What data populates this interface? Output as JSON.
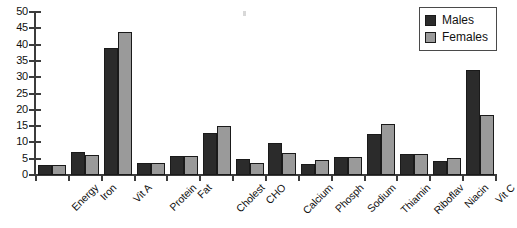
{
  "chart_data": {
    "type": "bar",
    "title": "",
    "xlabel": "",
    "ylabel": "",
    "ylim": [
      0,
      50
    ],
    "yticks": [
      0,
      5,
      10,
      15,
      20,
      25,
      30,
      35,
      40,
      45,
      50
    ],
    "grid": false,
    "legend_position": "top-right",
    "categories": [
      "Energy",
      "Iron",
      "Vit A",
      "Protein",
      "Fat",
      "Cholest",
      "CHO",
      "Calcium",
      "Phosph",
      "Sodium",
      "Thiamin",
      "Riboflav",
      "Niacin",
      "Vit C"
    ],
    "series": [
      {
        "name": "Males",
        "color": "#2b2b2b",
        "values": [
          3.0,
          7.0,
          39.0,
          3.7,
          5.8,
          13.0,
          4.9,
          9.7,
          3.5,
          5.5,
          12.7,
          6.5,
          4.4,
          32.3
        ]
      },
      {
        "name": "Females",
        "color": "#9a9a9a",
        "values": [
          3.0,
          6.0,
          44.0,
          3.6,
          5.8,
          15.0,
          3.6,
          6.7,
          4.6,
          5.5,
          15.5,
          6.4,
          5.3,
          18.3
        ]
      }
    ]
  },
  "legend": {
    "items": [
      {
        "label": "Males",
        "color": "#2b2b2b"
      },
      {
        "label": "Females",
        "color": "#9a9a9a"
      }
    ]
  },
  "axis": {
    "y_tick_labels": [
      "50",
      "45",
      "40",
      "35",
      "30",
      "25",
      "20",
      "15",
      "10",
      "5",
      "0"
    ],
    "y_max": 50,
    "y_min": 0
  }
}
